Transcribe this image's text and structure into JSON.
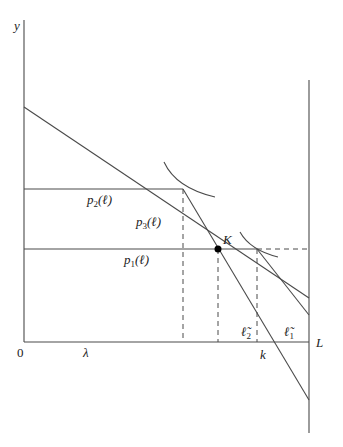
{
  "diagram": {
    "axes": {
      "y_label": "y",
      "origin_label": "0",
      "x_right_label": "L"
    },
    "x_markers": {
      "lambda": "λ",
      "k": "k"
    },
    "curve_labels": {
      "p2": {
        "base": "p",
        "sub": "2",
        "arg": "(ℓ)"
      },
      "p3": {
        "base": "p",
        "sub": "3",
        "arg": "(ℓ)"
      },
      "p1": {
        "base": "p",
        "sub": "1",
        "arg": "(ℓ)"
      }
    },
    "point_label": "K",
    "tilde_labels": {
      "l2": {
        "base": "ℓ̃",
        "sub": "2"
      },
      "l1": {
        "base": "ℓ̃",
        "sub": "1"
      }
    },
    "colors": {
      "line": "#4a4a4a",
      "text": "#222222",
      "point": "#000000"
    }
  }
}
